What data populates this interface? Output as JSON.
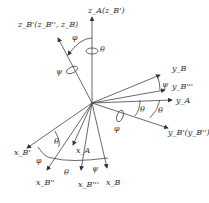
{
  "labels": {
    "zB1": "z_B'(z_B'', z_B)",
    "zA": "z_A(z_B')",
    "yB": "y_B",
    "yB3": "y_B'''",
    "yA": "y_A",
    "yB1": "y_B'(y_B'')",
    "xB1": "x_B'",
    "xB2": "x_B''",
    "xA": "x_A",
    "xB3": "x_B'''",
    "xB": "x_B",
    "phi": "φ",
    "theta": "θ",
    "psi": "ψ"
  }
}
